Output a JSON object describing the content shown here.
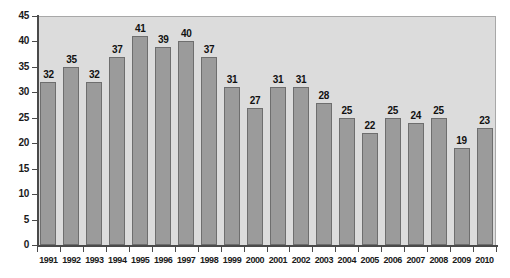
{
  "chart_data": {
    "type": "bar",
    "title": "",
    "subtitle": "",
    "xlabel": "",
    "ylabel": "",
    "ylim": [
      0,
      45
    ],
    "ytick_step": 5,
    "grid": false,
    "legend": null,
    "bar_color": "#9b9b9b",
    "bar_border_color": "#6e6e6e",
    "plot_background": "#dcdcdc",
    "axis_color": "#4a4a4a",
    "categories": [
      "1991",
      "1992",
      "1993",
      "1994",
      "1995",
      "1996",
      "1997",
      "1998",
      "1999",
      "2000",
      "2001",
      "2002",
      "2003",
      "2004",
      "2005",
      "2006",
      "2007",
      "2008",
      "2009",
      "2010"
    ],
    "values": [
      32,
      35,
      32,
      37,
      41,
      39,
      40,
      37,
      31,
      27,
      31,
      31,
      28,
      25,
      22,
      25,
      24,
      25,
      19,
      23
    ],
    "yticks": [
      0,
      5,
      10,
      15,
      20,
      25,
      30,
      35,
      40,
      45
    ],
    "ytick_labels": [
      "0",
      "5",
      "10",
      "15",
      "20",
      "25",
      "30",
      "35",
      "40",
      "45"
    ],
    "data_labels": [
      "32",
      "35",
      "32",
      "37",
      "41",
      "39",
      "40",
      "37",
      "31",
      "27",
      "31",
      "31",
      "28",
      "25",
      "22",
      "25",
      "24",
      "25",
      "19",
      "23"
    ]
  }
}
